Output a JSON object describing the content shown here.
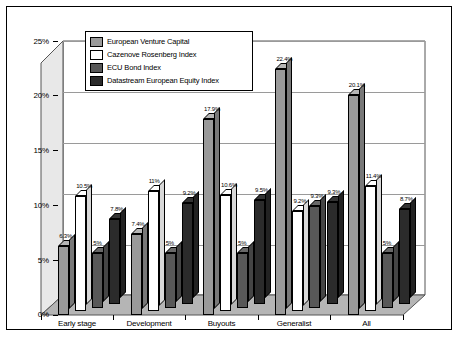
{
  "chart_data": {
    "type": "bar",
    "title": "",
    "xlabel": "",
    "ylabel": "",
    "ylim": [
      0,
      25
    ],
    "ytick_labels": [
      "0%",
      "5%",
      "10%",
      "15%",
      "20%",
      "25%"
    ],
    "ytick_values": [
      0,
      5,
      10,
      15,
      20,
      25
    ],
    "grid": true,
    "legend_position": "top-left inside plot",
    "categories": [
      "Early stage",
      "Development",
      "Buyouts",
      "Generalist",
      "All"
    ],
    "series": [
      {
        "name": "European Venture Capital",
        "color": "#9a9a9a",
        "values": [
          6.3,
          7.4,
          17.9,
          22.4,
          20.1
        ],
        "labels": [
          "6.3%",
          "7.4%",
          "17.9%",
          "22.4%",
          "20.1%"
        ]
      },
      {
        "name": "Cazenove Rosenberg Index",
        "color": "#ffffff",
        "values": [
          10.5,
          11.0,
          10.6,
          9.2,
          11.4
        ],
        "labels": [
          "10.5%",
          "11%",
          "10.6%",
          "9.2%",
          "11.4%"
        ]
      },
      {
        "name": "ECU Bond Index",
        "color": "#585858",
        "values": [
          5.0,
          5.0,
          5.0,
          9.3,
          5.0
        ],
        "labels": [
          "5%",
          "5%",
          "5%",
          "9.3%",
          "5%"
        ]
      },
      {
        "name": "Datastream European Equity Index",
        "color": "#2b2b2b",
        "values": [
          7.8,
          9.2,
          9.5,
          9.3,
          8.7
        ],
        "labels": [
          "7.8%",
          "9.2%",
          "9.5%",
          "9.3%",
          "8.7%"
        ]
      }
    ]
  },
  "legend": {
    "items": [
      {
        "label": "European Venture Capital",
        "swatch": "#9a9a9a"
      },
      {
        "label": "Cazenove Rosenberg Index",
        "swatch": "#ffffff"
      },
      {
        "label": "ECU Bond Index",
        "swatch": "#585858"
      },
      {
        "label": "Datastream European Equity Index",
        "swatch": "#2b2b2b"
      }
    ]
  },
  "colors": {
    "frame": "#000000",
    "plot_background": "#ffffff",
    "floor": "#b5b5b5",
    "wall": "#e8e8e8",
    "gridline": "#9a9a9a"
  }
}
